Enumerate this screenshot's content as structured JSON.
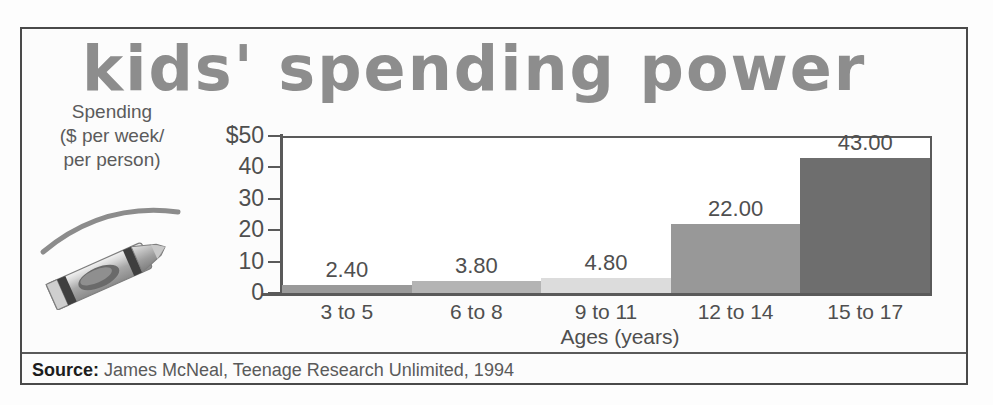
{
  "title": "kids' spending power",
  "ylabel_lines": [
    "Spending",
    "($ per week/",
    "per person)"
  ],
  "source": {
    "prefix": "Source:",
    "text": "James McNeal, Teenage Research Unlimited, 1994"
  },
  "illustration": {
    "name": "crayon-illustration",
    "description": "gray crayon with curved stroke arc"
  },
  "chart_data": {
    "type": "bar",
    "title": "kids' spending power",
    "categories": [
      "3 to 5",
      "6 to 8",
      "9 to 11",
      "12 to 14",
      "15 to 17"
    ],
    "values": [
      2.4,
      3.8,
      4.8,
      22.0,
      43.0
    ],
    "value_labels": [
      "2.40",
      "3.80",
      "4.80",
      "22.00",
      "43.00"
    ],
    "xlabel": "Ages (years)",
    "ylabel": "Spending ($ per week/ per person)",
    "ylim": [
      0,
      50
    ],
    "yticks": [
      0,
      10,
      20,
      30,
      40,
      50
    ],
    "ytick_labels": [
      "0",
      "10",
      "20",
      "30",
      "40",
      "$50"
    ],
    "grid": false,
    "legend": "none",
    "bar_colors": [
      "#9a9a9a",
      "#b4b4b4",
      "#dcdcdc",
      "#989898",
      "#6e6e6e"
    ]
  }
}
